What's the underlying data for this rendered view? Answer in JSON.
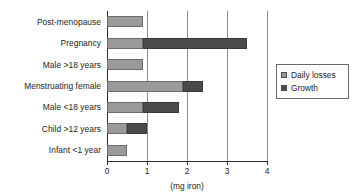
{
  "chart_data": {
    "type": "bar",
    "orientation": "horizontal",
    "stacked": true,
    "title": "",
    "xlabel": "(mg iron)",
    "ylabel": "",
    "xlim": [
      0,
      4
    ],
    "xticks": [
      "0",
      "1",
      "2",
      "3",
      "4"
    ],
    "grid": "vertical gridlines at 1, 2, 3, 4",
    "legend_position": "right",
    "categories": [
      "Post-menopause",
      "Pregnancy",
      "Male >18 years",
      "Menstruating female",
      "Male <18 years",
      "Child >12 years",
      "Infant <1 year"
    ],
    "series": [
      {
        "name": "Daily losses",
        "color": "#9a9a9a",
        "values": [
          0.9,
          0.9,
          0.9,
          1.9,
          0.9,
          0.5,
          0.5
        ]
      },
      {
        "name": "Growth",
        "color": "#4a4a4a",
        "values": [
          0,
          2.6,
          0,
          0.5,
          0.9,
          0.5,
          0
        ]
      }
    ],
    "totals": [
      0.9,
      3.5,
      0.9,
      2.4,
      1.8,
      1.0,
      0.5
    ]
  },
  "axis": {
    "x_title": "(mg iron)",
    "tick_labels": [
      "0",
      "1",
      "2",
      "3",
      "4"
    ]
  },
  "legend": {
    "items": [
      {
        "label": "Daily losses",
        "color": "#9a9a9a"
      },
      {
        "label": "Growth",
        "color": "#4a4a4a"
      }
    ]
  }
}
